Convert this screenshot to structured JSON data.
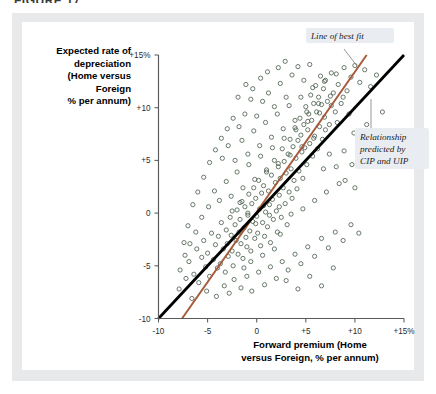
{
  "figure": {
    "title": "FIGURE 17",
    "panel_color": "#e8e9eb",
    "card_color": "#ffffff"
  },
  "chart_data": {
    "type": "scatter",
    "title": "",
    "xlabel": "Forward premium (Home versus Foreign, % per annum)",
    "ylabel": "Expected rate of depreciation (Home versus Foreign % per annum)",
    "ylabel_lines": [
      "Expected rate of",
      "depreciation",
      "(Home versus",
      "Foreign",
      "% per annum)"
    ],
    "xlabel_lines": [
      "Forward premium (Home",
      "versus Foreign, % per annum)"
    ],
    "xlim": [
      -10,
      15
    ],
    "ylim": [
      -10,
      15
    ],
    "xticks": [
      -10,
      -5,
      0,
      5,
      10,
      15
    ],
    "yticks": [
      -10,
      -5,
      0,
      5,
      10,
      15
    ],
    "xtick_labels": [
      "-10",
      "-5",
      "0",
      "+5",
      "+10",
      "+15%"
    ],
    "ytick_labels": [
      "-10",
      "-5",
      "0",
      "+5",
      "+10",
      "+15%"
    ],
    "grid": false,
    "legend": "none",
    "marker": {
      "shape": "open-circle",
      "radius": 2.1,
      "stroke_color": "#4f6350",
      "fill": "none"
    },
    "annotations": [
      {
        "name": "line-of-best-fit",
        "text": "Line of best fit",
        "lines": [
          "Line of best fit"
        ],
        "color": "#a65a3a"
      },
      {
        "name": "cip-uip-relationship",
        "text": "Relationship predicted by CIP and UIP",
        "lines": [
          "Relationship",
          "predicted by",
          "CIP and UIP"
        ],
        "color": "#000000"
      }
    ],
    "series": [
      {
        "name": "line-of-best-fit",
        "type": "line",
        "color": "#a65a3a",
        "width": 2.0,
        "points": [
          [
            -7.6,
            -10.0
          ],
          [
            11.2,
            15.0
          ]
        ],
        "slope": 1.33,
        "intercept": 0.1
      },
      {
        "name": "cip-uip-45-degree-line",
        "type": "line",
        "color": "#000000",
        "width": 2.8,
        "points": [
          [
            -10.0,
            -10.0
          ],
          [
            15.0,
            15.0
          ]
        ],
        "slope": 1.0,
        "intercept": 0.0
      },
      {
        "name": "observations",
        "type": "scatter",
        "color": "#4f6350",
        "points": [
          [
            -7.8,
            -5.4
          ],
          [
            -7.2,
            -6.2
          ],
          [
            -6.9,
            -4.6
          ],
          [
            -6.4,
            -5.8
          ],
          [
            -6.1,
            -3.4
          ],
          [
            -5.9,
            -6.6
          ],
          [
            -5.6,
            -4.2
          ],
          [
            -5.4,
            -2.6
          ],
          [
            -5.2,
            -5.1
          ],
          [
            -5.0,
            -3.8
          ],
          [
            -4.8,
            -6.0
          ],
          [
            -4.6,
            -1.9
          ],
          [
            -4.4,
            -4.4
          ],
          [
            -4.2,
            -3.0
          ],
          [
            -4.0,
            -5.2
          ],
          [
            -3.9,
            -2.2
          ],
          [
            -3.7,
            -4.8
          ],
          [
            -3.6,
            -0.9
          ],
          [
            -3.4,
            -3.4
          ],
          [
            -3.2,
            -5.6
          ],
          [
            -3.1,
            -1.6
          ],
          [
            -3.0,
            -2.9
          ],
          [
            -2.9,
            -4.1
          ],
          [
            -2.7,
            -0.4
          ],
          [
            -2.6,
            -2.1
          ],
          [
            -2.5,
            -3.6
          ],
          [
            -2.4,
            -5.0
          ],
          [
            -2.2,
            -1.1
          ],
          [
            -2.1,
            -2.6
          ],
          [
            -2.0,
            0.3
          ],
          [
            -1.9,
            -3.9
          ],
          [
            -1.8,
            -1.8
          ],
          [
            -1.7,
            -0.6
          ],
          [
            -1.6,
            -2.9
          ],
          [
            -1.5,
            1.1
          ],
          [
            -1.4,
            -4.3
          ],
          [
            -1.3,
            -1.4
          ],
          [
            -1.2,
            0.6
          ],
          [
            -1.1,
            -2.3
          ],
          [
            -1.0,
            -3.2
          ],
          [
            -0.9,
            -0.2
          ],
          [
            -0.8,
            1.8
          ],
          [
            -0.7,
            -1.7
          ],
          [
            -0.6,
            -3.6
          ],
          [
            -0.5,
            0.9
          ],
          [
            -0.4,
            -0.8
          ],
          [
            -0.3,
            2.4
          ],
          [
            -0.2,
            -2.4
          ],
          [
            -0.1,
            1.4
          ],
          [
            0.0,
            -0.3
          ],
          [
            0.1,
            -1.9
          ],
          [
            0.2,
            3.1
          ],
          [
            0.3,
            0.4
          ],
          [
            0.4,
            -3.1
          ],
          [
            0.5,
            1.9
          ],
          [
            0.6,
            -0.9
          ],
          [
            0.7,
            2.6
          ],
          [
            0.8,
            -2.2
          ],
          [
            0.9,
            0.1
          ],
          [
            1.0,
            4.1
          ],
          [
            1.1,
            -1.3
          ],
          [
            1.2,
            2.1
          ],
          [
            1.3,
            0.8
          ],
          [
            1.4,
            -2.8
          ],
          [
            1.5,
            3.6
          ],
          [
            1.6,
            1.3
          ],
          [
            1.7,
            -0.6
          ],
          [
            1.8,
            5.0
          ],
          [
            1.9,
            2.9
          ],
          [
            2.0,
            0.2
          ],
          [
            2.1,
            -1.8
          ],
          [
            2.2,
            4.4
          ],
          [
            2.3,
            1.7
          ],
          [
            2.4,
            3.3
          ],
          [
            2.5,
            -0.4
          ],
          [
            2.6,
            6.1
          ],
          [
            2.7,
            2.4
          ],
          [
            2.8,
            4.9
          ],
          [
            2.9,
            0.9
          ],
          [
            3.0,
            3.8
          ],
          [
            3.1,
            -1.1
          ],
          [
            3.2,
            5.6
          ],
          [
            3.3,
            2.0
          ],
          [
            3.4,
            7.0
          ],
          [
            3.5,
            4.2
          ],
          [
            3.6,
            1.4
          ],
          [
            3.7,
            6.3
          ],
          [
            3.8,
            3.1
          ],
          [
            3.9,
            8.1
          ],
          [
            4.0,
            5.2
          ],
          [
            4.1,
            2.3
          ],
          [
            4.2,
            6.9
          ],
          [
            4.3,
            4.0
          ],
          [
            4.4,
            9.0
          ],
          [
            4.5,
            7.4
          ],
          [
            4.6,
            5.8
          ],
          [
            4.7,
            3.3
          ],
          [
            4.8,
            8.4
          ],
          [
            4.9,
            6.2
          ],
          [
            5.0,
            10.1
          ],
          [
            5.1,
            4.6
          ],
          [
            5.2,
            7.9
          ],
          [
            5.3,
            9.4
          ],
          [
            5.4,
            6.6
          ],
          [
            5.5,
            11.2
          ],
          [
            5.6,
            8.8
          ],
          [
            5.7,
            5.4
          ],
          [
            5.8,
            10.4
          ],
          [
            5.9,
            7.3
          ],
          [
            6.0,
            12.1
          ],
          [
            6.1,
            9.6
          ],
          [
            6.2,
            6.1
          ],
          [
            6.3,
            11.0
          ],
          [
            6.4,
            8.2
          ],
          [
            6.5,
            13.0
          ],
          [
            6.6,
            10.3
          ],
          [
            6.7,
            7.0
          ],
          [
            6.8,
            11.8
          ],
          [
            6.9,
            9.1
          ],
          [
            7.0,
            12.6
          ],
          [
            7.2,
            10.6
          ],
          [
            7.4,
            8.4
          ],
          [
            7.6,
            13.3
          ],
          [
            7.8,
            11.4
          ],
          [
            8.0,
            9.6
          ],
          [
            8.3,
            12.2
          ],
          [
            8.6,
            10.4
          ],
          [
            8.9,
            13.8
          ],
          [
            9.2,
            11.6
          ],
          [
            9.6,
            12.9
          ],
          [
            10.0,
            14.0
          ],
          [
            10.5,
            12.4
          ],
          [
            11.0,
            13.6
          ],
          [
            11.6,
            12.0
          ],
          [
            12.2,
            13.1
          ],
          [
            -6.6,
            -8.1
          ],
          [
            -5.1,
            -7.4
          ],
          [
            -4.1,
            -7.9
          ],
          [
            -3.3,
            -6.9
          ],
          [
            -2.8,
            -7.6
          ],
          [
            -2.3,
            -6.3
          ],
          [
            -1.6,
            -7.1
          ],
          [
            -1.0,
            -6.0
          ],
          [
            -0.5,
            -7.4
          ],
          [
            0.2,
            -5.6
          ],
          [
            0.8,
            -6.8
          ],
          [
            1.4,
            -5.1
          ],
          [
            2.0,
            -6.2
          ],
          [
            2.6,
            -4.6
          ],
          [
            3.2,
            -5.4
          ],
          [
            3.9,
            -3.9
          ],
          [
            4.5,
            -4.8
          ],
          [
            5.2,
            -3.2
          ],
          [
            5.9,
            -4.1
          ],
          [
            6.6,
            -2.4
          ],
          [
            7.3,
            -3.3
          ],
          [
            8.0,
            -1.8
          ],
          [
            8.8,
            -2.6
          ],
          [
            9.6,
            -1.1
          ],
          [
            10.4,
            -1.9
          ],
          [
            -4.9,
            0.6
          ],
          [
            -4.3,
            2.1
          ],
          [
            -3.8,
            1.2
          ],
          [
            -3.1,
            3.0
          ],
          [
            -2.6,
            1.6
          ],
          [
            -2.0,
            3.9
          ],
          [
            -1.4,
            2.4
          ],
          [
            -0.8,
            4.6
          ],
          [
            -0.2,
            3.2
          ],
          [
            0.4,
            5.4
          ],
          [
            1.0,
            3.9
          ],
          [
            1.6,
            6.2
          ],
          [
            2.2,
            4.7
          ],
          [
            2.8,
            7.1
          ],
          [
            3.4,
            5.5
          ],
          [
            4.0,
            7.9
          ],
          [
            4.6,
            6.3
          ],
          [
            5.2,
            8.7
          ],
          [
            5.8,
            7.1
          ],
          [
            6.4,
            9.5
          ],
          [
            7.0,
            7.9
          ],
          [
            7.6,
            10.2
          ],
          [
            8.2,
            8.6
          ],
          [
            8.8,
            11.0
          ],
          [
            9.4,
            9.4
          ],
          [
            -3.5,
            5.2
          ],
          [
            -2.9,
            6.4
          ],
          [
            -2.2,
            5.0
          ],
          [
            -1.5,
            6.9
          ],
          [
            -0.9,
            5.6
          ],
          [
            -0.3,
            7.8
          ],
          [
            0.3,
            6.4
          ],
          [
            0.9,
            8.6
          ],
          [
            1.5,
            7.2
          ],
          [
            2.1,
            9.4
          ],
          [
            2.7,
            8.0
          ],
          [
            3.3,
            10.2
          ],
          [
            3.9,
            8.8
          ],
          [
            4.5,
            11.0
          ],
          [
            5.1,
            9.6
          ],
          [
            5.7,
            11.9
          ],
          [
            6.3,
            10.4
          ],
          [
            6.9,
            12.5
          ],
          [
            7.5,
            11.1
          ],
          [
            8.1,
            13.2
          ],
          [
            1.2,
            11.4
          ],
          [
            1.8,
            10.1
          ],
          [
            2.4,
            12.3
          ],
          [
            3.0,
            11.0
          ],
          [
            3.6,
            13.1
          ],
          [
            0.6,
            10.6
          ],
          [
            0.0,
            9.2
          ],
          [
            -0.6,
            10.8
          ],
          [
            -1.2,
            9.4
          ],
          [
            -1.8,
            8.2
          ],
          [
            -2.4,
            9.0
          ],
          [
            -3.0,
            8.0
          ],
          [
            -3.6,
            7.1
          ],
          [
            -4.2,
            6.0
          ],
          [
            -4.8,
            4.8
          ],
          [
            -5.4,
            3.4
          ],
          [
            -6.0,
            2.0
          ],
          [
            -6.5,
            0.8
          ],
          [
            -7.0,
            -1.2
          ],
          [
            -7.4,
            -2.8
          ],
          [
            4.2,
            13.9
          ],
          [
            4.8,
            12.6
          ],
          [
            5.4,
            14.1
          ],
          [
            2.2,
            13.8
          ],
          [
            2.9,
            14.4
          ],
          [
            -1.1,
            12.2
          ],
          [
            -0.4,
            11.8
          ],
          [
            0.4,
            12.8
          ],
          [
            1.1,
            13.4
          ],
          [
            -1.9,
            11.0
          ],
          [
            6.8,
            4.2
          ],
          [
            7.4,
            5.6
          ],
          [
            8.1,
            4.4
          ],
          [
            8.9,
            5.9
          ],
          [
            9.7,
            4.6
          ],
          [
            10.6,
            6.2
          ],
          [
            11.4,
            5.0
          ],
          [
            12.3,
            6.6
          ],
          [
            9.0,
            3.1
          ],
          [
            10.0,
            2.4
          ],
          [
            -5.6,
            -0.4
          ],
          [
            -6.2,
            -1.8
          ],
          [
            -6.8,
            -2.9
          ],
          [
            -7.3,
            -4.0
          ],
          [
            -7.9,
            -7.2
          ],
          [
            -2.5,
            0.2
          ],
          [
            -1.7,
            1.0
          ],
          [
            -0.9,
            0.0
          ],
          [
            -0.1,
            -1.0
          ],
          [
            0.7,
            0.7
          ],
          [
            1.3,
            -0.2
          ],
          [
            2.3,
            0.6
          ],
          [
            3.5,
            -0.1
          ],
          [
            4.7,
            0.4
          ],
          [
            5.9,
            1.2
          ],
          [
            7.1,
            2.0
          ],
          [
            8.4,
            2.8
          ],
          [
            9.9,
            7.6
          ],
          [
            11.2,
            8.4
          ],
          [
            12.8,
            9.6
          ],
          [
            3.0,
            -6.4
          ],
          [
            4.2,
            -7.2
          ],
          [
            5.4,
            -6.0
          ],
          [
            6.6,
            -6.9
          ],
          [
            7.8,
            -5.2
          ],
          [
            -0.6,
            -4.6
          ],
          [
            0.6,
            -4.0
          ],
          [
            1.8,
            -3.4
          ],
          [
            2.4,
            -2.0
          ],
          [
            -1.3,
            -5.2
          ]
        ]
      }
    ]
  }
}
